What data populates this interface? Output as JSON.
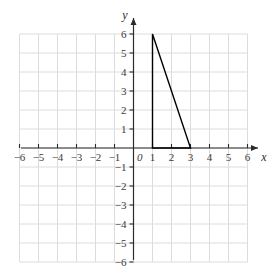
{
  "figure": {
    "background_color": "#ffffff",
    "grid_color": "#dcdcdc",
    "axis_color": "#2b2b2b",
    "shape_color": "#000000",
    "label_color": "#3a3a3a"
  },
  "axes": {
    "x_name": "x",
    "y_name": "y",
    "origin_label": "0",
    "x_ticks": [
      "−6",
      "−5",
      "−4",
      "−3",
      "−2",
      "−1",
      "1",
      "2",
      "3",
      "4",
      "5",
      "6"
    ],
    "y_ticks": [
      "6",
      "5",
      "4",
      "3",
      "2",
      "1",
      "−1",
      "−2",
      "−3",
      "−4",
      "−5",
      "−6"
    ]
  },
  "chart_data": {
    "type": "scatter",
    "title": "",
    "xlabel": "x",
    "ylabel": "y",
    "xlim": [
      -6,
      6
    ],
    "ylim": [
      -6,
      6
    ],
    "grid": true,
    "legend": "none",
    "x_tick_values": [
      -6,
      -5,
      -4,
      -3,
      -2,
      -1,
      1,
      2,
      3,
      4,
      5,
      6
    ],
    "y_tick_values": [
      6,
      5,
      4,
      3,
      2,
      1,
      -1,
      -2,
      -3,
      -4,
      -5,
      -6
    ],
    "annotations": [],
    "series": [
      {
        "name": "triangle",
        "type": "polygon",
        "closed": true,
        "fill": "none",
        "stroke": "#000000",
        "points": [
          {
            "x": 1,
            "y": 0
          },
          {
            "x": 1,
            "y": 6
          },
          {
            "x": 3,
            "y": 0
          }
        ],
        "vertices_label": [
          "(1, 0)",
          "(1, 6)",
          "(3, 0)"
        ]
      }
    ]
  }
}
